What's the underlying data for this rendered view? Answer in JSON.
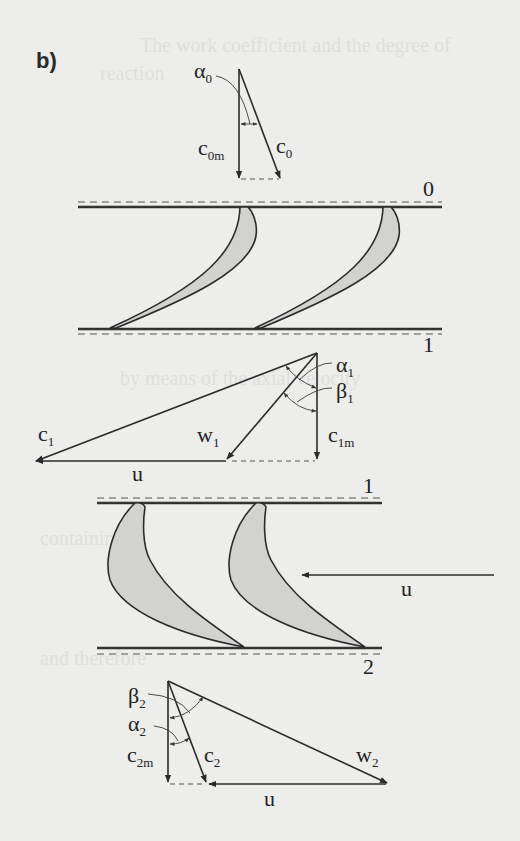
{
  "panel_label": "b)",
  "colors": {
    "background": "#ededeb",
    "ink": "#2b2b2b",
    "blade_fill": "#d2d2d0"
  },
  "planes": {
    "p0": "0",
    "p1_stator": "1",
    "p1_rotor": "1",
    "p2": "2"
  },
  "inlet_triangle": {
    "angle": {
      "sym": "α",
      "sub": "0"
    },
    "c_m": {
      "sym": "c",
      "sub": "0m"
    },
    "c": {
      "sym": "c",
      "sub": "0"
    }
  },
  "stage1_triangle": {
    "alpha": {
      "sym": "α",
      "sub": "1"
    },
    "beta": {
      "sym": "β",
      "sub": "1"
    },
    "c": {
      "sym": "c",
      "sub": "1"
    },
    "w": {
      "sym": "w",
      "sub": "1"
    },
    "c_m": {
      "sym": "c",
      "sub": "1m"
    },
    "u": "u"
  },
  "rotor": {
    "blade_speed_label": "u"
  },
  "stage2_triangle": {
    "beta": {
      "sym": "β",
      "sub": "2"
    },
    "alpha": {
      "sym": "α",
      "sub": "2"
    },
    "c_m": {
      "sym": "c",
      "sub": "2m"
    },
    "c": {
      "sym": "c",
      "sub": "2"
    },
    "w": {
      "sym": "w",
      "sub": "2"
    },
    "u": "u"
  },
  "ghost_text": [
    "The work coefficient and the degree of",
    "reaction",
    "by means of the axial velocity",
    "containing",
    "and therefore"
  ]
}
